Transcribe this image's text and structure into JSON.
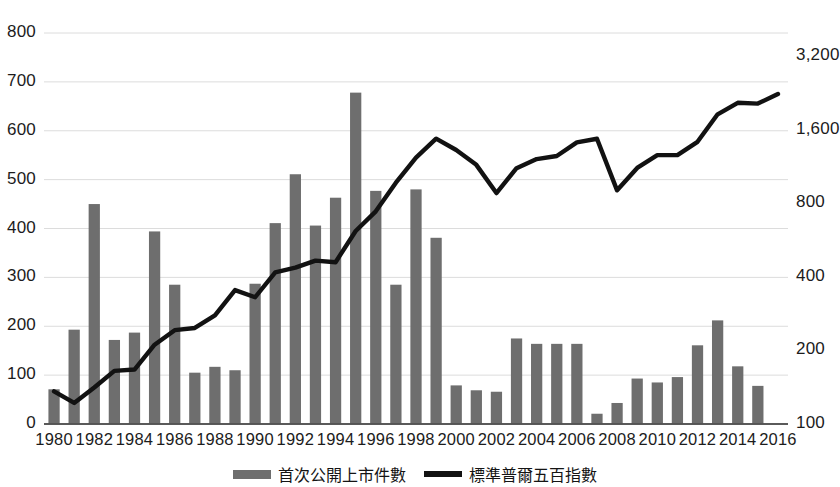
{
  "chart_data": {
    "type": "bar",
    "title": "",
    "subtitle": "",
    "xlabel": "",
    "ylabel": "",
    "y2label": "",
    "grid": true,
    "legend_position": "bottom",
    "x": [
      1980,
      1981,
      1982,
      1983,
      1984,
      1985,
      1986,
      1987,
      1988,
      1989,
      1990,
      1991,
      1992,
      1993,
      1994,
      1995,
      1996,
      1997,
      1998,
      1999,
      2000,
      2001,
      2002,
      2003,
      2004,
      2005,
      2006,
      2007,
      2008,
      2009,
      2010,
      2011,
      2012,
      2013,
      2014,
      2015,
      2016
    ],
    "xtick_labels": [
      "1980",
      "1982",
      "1984",
      "1986",
      "1988",
      "1990",
      "1992",
      "1994",
      "1996",
      "1998",
      "2000",
      "2002",
      "2004",
      "2006",
      "2008",
      "2010",
      "2012",
      "2014",
      "2016"
    ],
    "xtick_values": [
      1980,
      1982,
      1984,
      1986,
      1988,
      1990,
      1992,
      1994,
      1996,
      1998,
      2000,
      2002,
      2004,
      2006,
      2008,
      2010,
      2012,
      2014,
      2016
    ],
    "yaxis_left": {
      "ticks": [
        0,
        100,
        200,
        300,
        400,
        500,
        600,
        700,
        800
      ],
      "tick_labels": [
        "0",
        "100",
        "200",
        "300",
        "400",
        "500",
        "600",
        "700",
        "800"
      ],
      "ylim": [
        0,
        800
      ],
      "scale": "linear"
    },
    "yaxis_right": {
      "ticks": [
        100,
        200,
        400,
        800,
        1600,
        3200
      ],
      "tick_labels": [
        "100",
        "200",
        "400",
        "800",
        "1,600",
        "3,200"
      ],
      "ylim": [
        100,
        3200
      ],
      "scale": "log"
    },
    "series": [
      {
        "name": "首次公開上市件數",
        "type": "bar",
        "axis": "left",
        "color": "#6e6e6e",
        "values": [
          71,
          193,
          450,
          172,
          187,
          394,
          285,
          105,
          117,
          110,
          287,
          411,
          511,
          406,
          463,
          678,
          477,
          285,
          480,
          381,
          79,
          69,
          66,
          175,
          164,
          164,
          164,
          21,
          43,
          93,
          85,
          96,
          161,
          212,
          118,
          78,
          0
        ]
      },
      {
        "name": "標準普爾五百指數",
        "type": "line",
        "axis": "right",
        "color": "#121212",
        "values": [
          136,
          122,
          141,
          165,
          167,
          211,
          242,
          247,
          278,
          353,
          330,
          417,
          436,
          466,
          459,
          616,
          741,
          970,
          1229,
          1469,
          1320,
          1148,
          880,
          1112,
          1212,
          1248,
          1418,
          1468,
          903,
          1115,
          1258,
          1258,
          1426,
          1848,
          2059,
          2044,
          2239
        ]
      }
    ],
    "annotations": []
  },
  "legend": {
    "entries": [
      {
        "label": "首次公開上市件數",
        "marker": "bar",
        "color": "#6e6e6e"
      },
      {
        "label": "標準普爾五百指數",
        "marker": "line",
        "color": "#121212"
      }
    ]
  },
  "axis_left_labels": [
    "800",
    "700",
    "600",
    "500",
    "400",
    "300",
    "200",
    "100",
    "0"
  ],
  "axis_right_labels": [
    "3,200",
    "1,600",
    "800",
    "400",
    "200",
    "100"
  ]
}
